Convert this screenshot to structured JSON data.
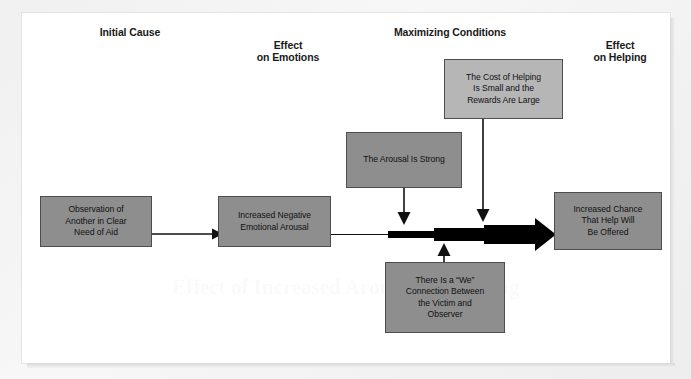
{
  "figure": {
    "kind": "flowchart",
    "background_color": "#ffffff",
    "box_fill_dark": "#8e8e8e",
    "box_fill_light": "#b6b6b6",
    "box_border_color": "#4e4e4e",
    "arrow_color": "#000000",
    "bleed_artifact_text": "Effect of Increased Arousal on Helping"
  },
  "headers": [
    {
      "id": "initial-cause",
      "label": "Initial Cause"
    },
    {
      "id": "effect-on-emotions",
      "label": "Effect\non Emotions"
    },
    {
      "id": "maximizing-conditions",
      "label": "Maximizing Conditions"
    },
    {
      "id": "effect-on-helping",
      "label": "Effect\non Helping"
    }
  ],
  "nodes": [
    {
      "id": "observation",
      "label": "Observation of\nAnother in Clear\nNeed of Aid",
      "fill": "dark",
      "column": "initial-cause"
    },
    {
      "id": "increased-negative-arousal",
      "label": "Increased Negative\nEmotional Arousal",
      "fill": "dark",
      "column": "effect-on-emotions"
    },
    {
      "id": "arousal-strong",
      "label": "The Arousal Is Strong",
      "fill": "dark",
      "column": "maximizing-conditions"
    },
    {
      "id": "cost-of-helping",
      "label": "The Cost of Helping\nIs Small and the\nRewards Are Large",
      "fill": "light",
      "column": "maximizing-conditions"
    },
    {
      "id": "we-connection",
      "label": "There Is a “We”\nConnection Between\nthe Victim and\nObserver",
      "fill": "dark",
      "column": "maximizing-conditions"
    },
    {
      "id": "increased-chance-help",
      "label": "Increased Chance\nThat Help Will\nBe Offered",
      "fill": "dark",
      "column": "effect-on-helping"
    }
  ],
  "connections": [
    {
      "id": "observation-to-arousal",
      "from": "observation",
      "to": "increased-negative-arousal",
      "style": "thin-arrow"
    },
    {
      "id": "arousal-to-helping",
      "from": "increased-negative-arousal",
      "to": "increased-chance-help",
      "style": "growing-arrow"
    },
    {
      "id": "strong-into-flow",
      "from": "arousal-strong",
      "to": "arousal-to-helping",
      "style": "thin-arrow-down"
    },
    {
      "id": "cost-into-flow",
      "from": "cost-of-helping",
      "to": "arousal-to-helping",
      "style": "thin-arrow-down"
    },
    {
      "id": "we-into-flow",
      "from": "we-connection",
      "to": "arousal-to-helping",
      "style": "thin-arrow-up"
    }
  ]
}
